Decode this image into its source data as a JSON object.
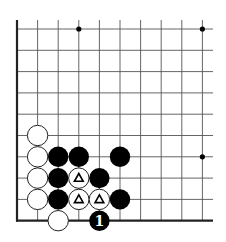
{
  "board": {
    "description": "Go problem diagram, lower-left corner of the board",
    "origin": {
      "x": 17,
      "y": 29
    },
    "spacing": {
      "x": 20.6,
      "y": 21.3
    },
    "columns": 10,
    "rows": 10,
    "right_extension": 213,
    "top_extension": 20,
    "edges": [
      "left",
      "bottom"
    ],
    "star_points": [
      {
        "col": 3,
        "row": 0
      },
      {
        "col": 9,
        "row": 0
      },
      {
        "col": 9,
        "row": 6
      }
    ],
    "stones": [
      {
        "color": "white",
        "col": 1,
        "row": 5
      },
      {
        "color": "white",
        "col": 1,
        "row": 6
      },
      {
        "color": "white",
        "col": 1,
        "row": 7
      },
      {
        "color": "white",
        "col": 1,
        "row": 8
      },
      {
        "color": "white",
        "col": 2,
        "row": 9
      },
      {
        "color": "black",
        "col": 2,
        "row": 6
      },
      {
        "color": "black",
        "col": 3,
        "row": 6
      },
      {
        "color": "black",
        "col": 5,
        "row": 6
      },
      {
        "color": "black",
        "col": 2,
        "row": 7
      },
      {
        "color": "white",
        "col": 3,
        "row": 7,
        "mark": "triangle"
      },
      {
        "color": "black",
        "col": 4,
        "row": 7
      },
      {
        "color": "black",
        "col": 2,
        "row": 8
      },
      {
        "color": "white",
        "col": 3,
        "row": 8,
        "mark": "triangle"
      },
      {
        "color": "white",
        "col": 4,
        "row": 8,
        "mark": "triangle"
      },
      {
        "color": "black",
        "col": 5,
        "row": 8
      },
      {
        "color": "black",
        "col": 4,
        "row": 9,
        "label": "1"
      }
    ],
    "colors": {
      "black_stone": "#000000",
      "white_stone": "#ffffff",
      "line": "#555555",
      "edge": "#222222"
    }
  }
}
